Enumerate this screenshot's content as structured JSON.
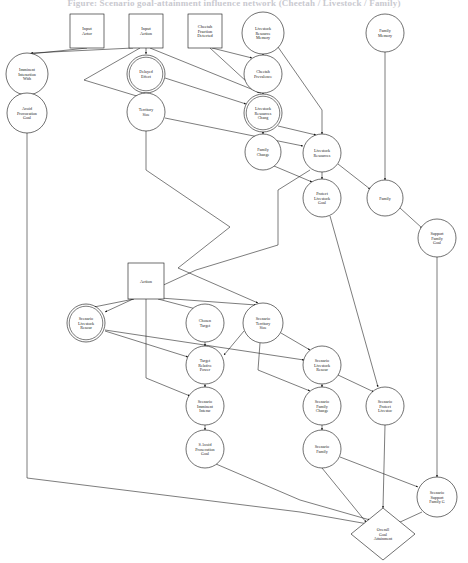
{
  "title": "Figure: Scenario goal-attainment influence network (Cheetah / Livestock / Family)",
  "diagram": {
    "type": "directed-graph",
    "width": 468,
    "height": 563,
    "node_shapes": {
      "box": "rectangle",
      "ellipse": "circle",
      "doublecircle": "double circle",
      "diamond": "diamond"
    },
    "nodes": [
      {
        "id": "input_actor",
        "label": [
          "Input",
          "Actor"
        ],
        "shape": "box",
        "x": 87,
        "y": 31,
        "w": 34,
        "h": 34
      },
      {
        "id": "input_action",
        "label": [
          "Input",
          "Action"
        ],
        "shape": "box",
        "x": 146,
        "y": 31,
        "w": 34,
        "h": 34
      },
      {
        "id": "cheetah_fraction",
        "label": [
          "Cheetah",
          "Fraction",
          "Detected"
        ],
        "shape": "box",
        "x": 205,
        "y": 31,
        "w": 34,
        "h": 34
      },
      {
        "id": "livestock_res_mem",
        "label": [
          "Livestock",
          "Resource",
          "Memory"
        ],
        "shape": "ellipse",
        "x": 263,
        "y": 33,
        "r": 21
      },
      {
        "id": "family_memory",
        "label": [
          "Family",
          "Memory"
        ],
        "shape": "ellipse",
        "x": 385,
        "y": 33,
        "r": 19
      },
      {
        "id": "imminent_inter",
        "label": [
          "Imminent",
          "Interaction",
          "With"
        ],
        "shape": "ellipse",
        "x": 27,
        "y": 74,
        "r": 21
      },
      {
        "id": "delayed_effect",
        "label": [
          "Delayed",
          "Effect"
        ],
        "shape": "doublecircle",
        "x": 146,
        "y": 74,
        "r": 19
      },
      {
        "id": "cheetah_prev",
        "label": [
          "Cheetah",
          "Prevalence"
        ],
        "shape": "ellipse",
        "x": 263,
        "y": 74,
        "r": 19
      },
      {
        "id": "avoid_prov_goal",
        "label": [
          "Avoid",
          "Provocation",
          "Goal"
        ],
        "shape": "ellipse",
        "x": 27,
        "y": 113,
        "r": 20
      },
      {
        "id": "territory_size",
        "label": [
          "Territory",
          "Size"
        ],
        "shape": "ellipse",
        "x": 146,
        "y": 112,
        "r": 19
      },
      {
        "id": "livestock_res_chg",
        "label": [
          "Livestock",
          "Resources",
          "Chang"
        ],
        "shape": "doublecircle",
        "x": 263,
        "y": 113,
        "r": 19
      },
      {
        "id": "family_change",
        "label": [
          "Family",
          "Change"
        ],
        "shape": "ellipse",
        "x": 263,
        "y": 152,
        "r": 18
      },
      {
        "id": "livestock_res",
        "label": [
          "Livestock",
          "Resources"
        ],
        "shape": "ellipse",
        "x": 322,
        "y": 153,
        "r": 19
      },
      {
        "id": "protect_lv_goal",
        "label": [
          "Protect",
          "Livestock",
          "Goal"
        ],
        "shape": "ellipse",
        "x": 322,
        "y": 198,
        "r": 19
      },
      {
        "id": "family",
        "label": [
          "Family"
        ],
        "shape": "ellipse",
        "x": 385,
        "y": 198,
        "r": 18
      },
      {
        "id": "support_fam_goal",
        "label": [
          "Support",
          "Family",
          "Goal"
        ],
        "shape": "ellipse",
        "x": 437,
        "y": 238,
        "r": 19
      },
      {
        "id": "action",
        "label": [
          "Action"
        ],
        "shape": "box",
        "x": 146,
        "y": 281,
        "w": 36,
        "h": 36
      },
      {
        "id": "sc_livestock_res",
        "label": [
          "Scenario",
          "Livestock",
          "Resour"
        ],
        "shape": "doublecircle",
        "x": 86,
        "y": 323,
        "r": 19
      },
      {
        "id": "chosen_target",
        "label": [
          "Chosen",
          "Target"
        ],
        "shape": "ellipse",
        "x": 205,
        "y": 323,
        "r": 19
      },
      {
        "id": "sc_territory_size",
        "label": [
          "Scenario",
          "Territory",
          "Size"
        ],
        "shape": "ellipse",
        "x": 263,
        "y": 323,
        "r": 20
      },
      {
        "id": "target_rel_power",
        "label": [
          "Target",
          "Relative",
          "Power"
        ],
        "shape": "ellipse",
        "x": 205,
        "y": 365,
        "r": 19
      },
      {
        "id": "sc_livestock_res2",
        "label": [
          "Scenario",
          "Livestock",
          "Resour"
        ],
        "shape": "ellipse",
        "x": 322,
        "y": 365,
        "r": 19
      },
      {
        "id": "sc_imminent_inter",
        "label": [
          "Scenario",
          "Imminent",
          "Interac"
        ],
        "shape": "ellipse",
        "x": 205,
        "y": 406,
        "r": 19
      },
      {
        "id": "sc_family_change",
        "label": [
          "Scenario",
          "Family",
          "Change"
        ],
        "shape": "ellipse",
        "x": 322,
        "y": 406,
        "r": 19
      },
      {
        "id": "sc_protect_lv",
        "label": [
          "Scenario",
          "Protect",
          "Livestoc"
        ],
        "shape": "ellipse",
        "x": 385,
        "y": 406,
        "r": 19
      },
      {
        "id": "s_avoid_prov_goal",
        "label": [
          "S Avoid",
          "Prosecution",
          "Goal"
        ],
        "shape": "ellipse",
        "x": 205,
        "y": 449,
        "r": 19
      },
      {
        "id": "sc_family",
        "label": [
          "Scenario",
          "Family"
        ],
        "shape": "ellipse",
        "x": 322,
        "y": 449,
        "r": 19
      },
      {
        "id": "sc_support_fam",
        "label": [
          "Scenario",
          "Support",
          "Family G"
        ],
        "shape": "ellipse",
        "x": 437,
        "y": 497,
        "r": 20
      },
      {
        "id": "overall_goal",
        "label": [
          "Overall",
          "Goal",
          "Attainment"
        ],
        "shape": "diamond",
        "x": 383,
        "y": 534,
        "rx": 32,
        "ry": 26
      }
    ],
    "edges": [
      {
        "from": "input_actor",
        "to": "imminent_inter",
        "path": "M 87,48 L 30,54"
      },
      {
        "from": "input_action",
        "to": "imminent_inter",
        "path": "M 133,48 L 31,53"
      },
      {
        "from": "input_action",
        "to": "delayed_effect",
        "path": "M 146,48 L 146,54"
      },
      {
        "from": "input_action",
        "to": "livestock_res_chg",
        "path": "M 150,48 L 261,93"
      },
      {
        "from": "input_action",
        "to": "territory_size",
        "path": "M 140,48 L 84,80 L 140,97"
      },
      {
        "from": "cheetah_fraction",
        "to": "livestock_res_chg",
        "path": "M 210,48 L 259,93"
      },
      {
        "from": "cheetah_fraction",
        "to": "cheetah_prev",
        "path": "M 212,48 L 252,58"
      },
      {
        "from": "livestock_res_mem",
        "to": "cheetah_prev",
        "path": "M 263,54 L 263,55"
      },
      {
        "from": "livestock_res_mem",
        "to": "livestock_res",
        "path": "M 278,47 L 322,110 L 322,134"
      },
      {
        "from": "cheetah_prev",
        "to": "livestock_res_chg",
        "path": "M 263,93 L 263,94"
      },
      {
        "from": "delayed_effect",
        "to": "territory_size",
        "path": "M 146,93 L 146,93"
      },
      {
        "from": "delayed_effect",
        "to": "livestock_res_chg",
        "path": "M 165,78 L 246,104"
      },
      {
        "from": "imminent_inter",
        "to": "avoid_prov_goal",
        "path": "M 27,95 L 27,93"
      },
      {
        "from": "livestock_res_chg",
        "to": "family_change",
        "path": "M 263,132 L 263,134"
      },
      {
        "from": "livestock_res_chg",
        "to": "livestock_res",
        "path": "M 278,126 L 316,135"
      },
      {
        "from": "territory_size",
        "to": "livestock_res",
        "path": "M 165,118 L 303,146"
      },
      {
        "from": "territory_size",
        "to": "sc_territory_size",
        "path": "M 146,131 L 146,170 L 230,227 L 178,268 L 258,303"
      },
      {
        "from": "family_change",
        "to": "protect_lv_goal",
        "path": "M 274,166 L 312,182"
      },
      {
        "from": "livestock_res",
        "to": "protect_lv_goal",
        "path": "M 322,172 L 322,179"
      },
      {
        "from": "livestock_res",
        "to": "family",
        "path": "M 338,164 L 370,189"
      },
      {
        "from": "livestock_res",
        "to": "sc_livestock_res",
        "path": "M 310,170 L 278,190 L 278,245 L 196,270 L 105,312"
      },
      {
        "from": "family_memory",
        "to": "family",
        "path": "M 385,52 L 385,180"
      },
      {
        "from": "family",
        "to": "support_fam_goal",
        "path": "M 400,208 L 422,228"
      },
      {
        "from": "protect_lv_goal",
        "to": "sc_protect_lv",
        "path": "M 330,216 L 378,387"
      },
      {
        "from": "support_fam_goal",
        "to": "sc_support_fam",
        "path": "M 437,257 L 437,477"
      },
      {
        "from": "action",
        "to": "sc_livestock_res",
        "path": "M 134,299 L 94,307"
      },
      {
        "from": "action",
        "to": "chosen_target",
        "path": "M 158,299 L 196,309"
      },
      {
        "from": "action",
        "to": "sc_territory_size",
        "path": "M 160,298 L 256,305"
      },
      {
        "from": "action",
        "to": "sc_imminent_inter",
        "path": "M 146,299 L 146,378 L 190,396"
      },
      {
        "from": "sc_livestock_res",
        "to": "target_rel_power",
        "path": "M 105,331 L 188,357"
      },
      {
        "from": "sc_livestock_res",
        "to": "sc_livestock_res2",
        "path": "M 105,330 L 304,360"
      },
      {
        "from": "chosen_target",
        "to": "target_rel_power",
        "path": "M 205,342 L 205,346"
      },
      {
        "from": "sc_territory_size",
        "to": "target_rel_power",
        "path": "M 244,331 L 224,355"
      },
      {
        "from": "sc_territory_size",
        "to": "sc_livestock_res2",
        "path": "M 281,333 L 310,350"
      },
      {
        "from": "sc_territory_size",
        "to": "sc_family_change",
        "path": "M 260,343 L 258,370 L 310,391"
      },
      {
        "from": "target_rel_power",
        "to": "sc_imminent_inter",
        "path": "M 205,384 L 205,387"
      },
      {
        "from": "sc_livestock_res2",
        "to": "sc_family_change",
        "path": "M 322,384 L 322,387"
      },
      {
        "from": "sc_livestock_res2",
        "to": "sc_protect_lv",
        "path": "M 338,375 L 374,392"
      },
      {
        "from": "sc_imminent_inter",
        "to": "s_avoid_prov_goal",
        "path": "M 205,425 L 205,430"
      },
      {
        "from": "sc_family_change",
        "to": "sc_family",
        "path": "M 322,425 L 322,430"
      },
      {
        "from": "sc_family",
        "to": "sc_support_fam",
        "path": "M 340,457 L 418,487"
      },
      {
        "from": "sc_family",
        "to": "overall_goal",
        "path": "M 322,468 L 366,522"
      },
      {
        "from": "sc_protect_lv",
        "to": "overall_goal",
        "path": "M 385,425 L 383,508"
      },
      {
        "from": "s_avoid_prov_goal",
        "to": "overall_goal",
        "path": "M 216,464 L 300,500 L 370,520"
      },
      {
        "from": "sc_support_fam",
        "to": "overall_goal",
        "path": "M 422,512 L 398,523"
      },
      {
        "from": "avoid_prov_goal",
        "to": "overall_goal",
        "path": "M 27,133 L 27,478 L 300,512 L 368,524"
      }
    ]
  }
}
